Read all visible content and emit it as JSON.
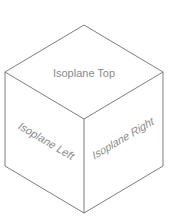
{
  "diagram": {
    "faces": {
      "top": {
        "label": "Isoplane Top"
      },
      "left": {
        "label": "Isoplane Left"
      },
      "right": {
        "label": "Isoplane Right"
      }
    },
    "colors": {
      "edge": "#6e6e6e",
      "text": "#8a8a8a",
      "background": "#ffffff"
    }
  }
}
